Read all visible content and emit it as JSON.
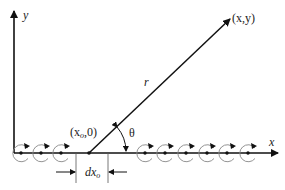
{
  "diagram": {
    "type": "vortex-sheet-geometry",
    "labels": {
      "y_axis": "y",
      "x_axis": "x",
      "point": "(x,y)",
      "radius": "r",
      "angle": "θ",
      "source_point": "(x",
      "source_point_sub": "o",
      "source_point_tail": ",0)",
      "dx": "dx",
      "dx_sub": "o"
    },
    "colors": {
      "line": "#111111",
      "vortex": "#888888",
      "background": "#ffffff"
    },
    "vortices_left": [
      34,
      54,
      74
    ],
    "vortices_right": [
      147,
      167,
      187,
      207,
      227,
      247
    ],
    "origin": {
      "x": 14,
      "y": 153
    },
    "source": {
      "x": 89,
      "y": 153
    },
    "tip": {
      "x": 230,
      "y": 17
    }
  }
}
